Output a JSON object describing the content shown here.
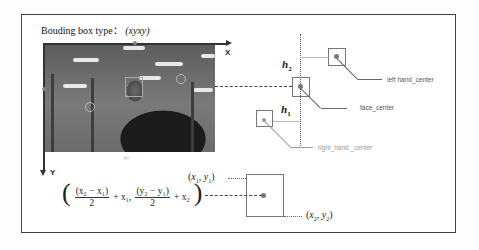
{
  "figure": {
    "title_prefix": "Bouding box type：",
    "title_type": "(xyxy)",
    "axes": {
      "x_label": "X",
      "y_label": "Y"
    },
    "photo_caption": "(c)",
    "annotations": {
      "left_hand": "left hand_center",
      "face": "face_center",
      "right_hand": "right_hand _center",
      "h1": "h",
      "h1_sub": "1",
      "h2": "h",
      "h2_sub": "2"
    },
    "bbox": {
      "top_left": {
        "label_open": "(",
        "x": "x",
        "x_sub": "1",
        "sep": ", ",
        "y": "y",
        "y_sub": "1",
        "label_close": ")"
      },
      "bottom_right": {
        "label_open": "(",
        "x": "x",
        "x_sub": "2",
        "sep": ", ",
        "y": "y",
        "y_sub": "2",
        "label_close": ")"
      }
    },
    "center_formula": {
      "open": "(",
      "frac1_num": "(x₂ − x₁)",
      "frac1_den": "2",
      "term1": "+ x₁,",
      "frac2_num": "(y₂ − y₁)",
      "frac2_den": "2",
      "term2": "+ x₂",
      "close": ")"
    }
  },
  "colors": {
    "frame": "#444444",
    "box": "#777777",
    "leader": "#666666",
    "center_dot": "#777777"
  }
}
